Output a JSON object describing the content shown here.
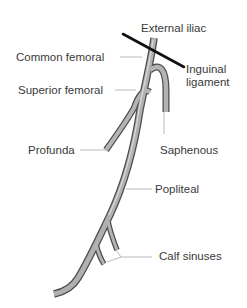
{
  "diagram": {
    "colors": {
      "vein_fill": "#a9a9a9",
      "vein_outline": "#4d4d4d",
      "ligament": "#111111",
      "leader": "#9a9a9a",
      "text": "#3a3a3a"
    },
    "labels": {
      "external_iliac": "External iliac",
      "common_femoral": "Common femoral",
      "inguinal_ligament_line1": "Inguinal",
      "inguinal_ligament_line2": "ligament",
      "superior_femoral": "Superior femoral",
      "profunda": "Profunda",
      "saphenous": "Saphenous",
      "popliteal": "Popliteal",
      "calf_sinuses": "Calf sinuses"
    }
  }
}
